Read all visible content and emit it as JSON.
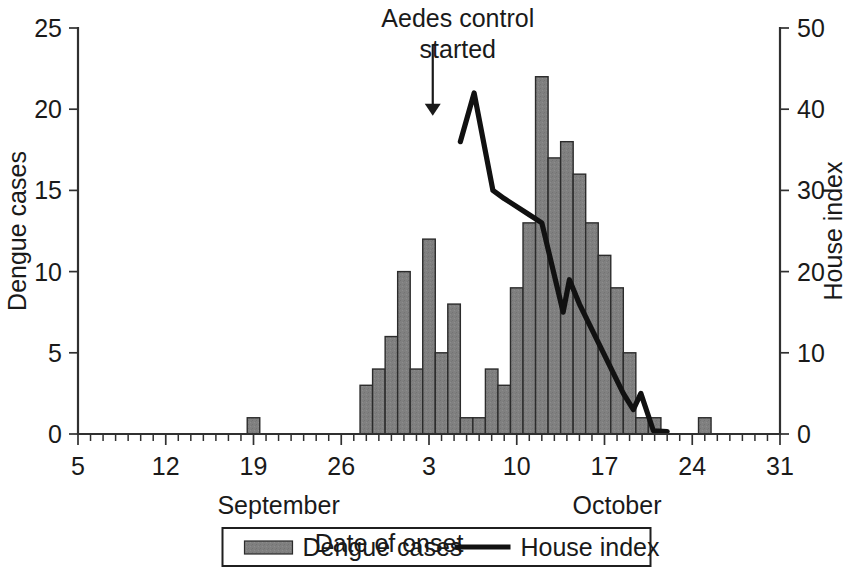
{
  "chart_data": {
    "type": "bar",
    "title": "",
    "xlabel": "Date of onset",
    "ylabel": "Dengue cases",
    "y2label": "House index",
    "ylim": [
      0,
      25
    ],
    "y2lim": [
      0,
      50
    ],
    "grid": false,
    "xlim_day": [
      5,
      31
    ],
    "x_tick_labels": [
      "5",
      "12",
      "19",
      "26",
      "3",
      "10",
      "17",
      "24",
      "31"
    ],
    "x_tick_days": [
      5,
      12,
      19,
      26,
      33,
      40,
      47,
      54,
      61
    ],
    "x_minor_step_days": 1,
    "y_tick_labels": [
      "0",
      "5",
      "10",
      "15",
      "20",
      "25"
    ],
    "y_tick_values": [
      0,
      5,
      10,
      15,
      20,
      25
    ],
    "y2_tick_labels": [
      "0",
      "10",
      "20",
      "30",
      "40",
      "50"
    ],
    "y2_tick_values": [
      0,
      10,
      20,
      30,
      40,
      50
    ],
    "month_labels": [
      {
        "text": "September",
        "day": 21
      },
      {
        "text": "October",
        "day": 48
      }
    ],
    "categories": [
      "Sep 19",
      "Sep 28",
      "Sep 29",
      "Sep 30",
      "Oct 1",
      "Oct 2",
      "Oct 3",
      "Oct 4",
      "Oct 5",
      "Oct 6",
      "Oct 7",
      "Oct 8",
      "Oct 9",
      "Oct 10",
      "Oct 11",
      "Oct 12",
      "Oct 13",
      "Oct 14",
      "Oct 15",
      "Oct 16",
      "Oct 17",
      "Oct 18",
      "Oct 19",
      "Oct 20",
      "Oct 21",
      "Oct 25"
    ],
    "series": [
      {
        "name": "Dengue cases",
        "kind": "bar",
        "axis": "left",
        "color": "#808080",
        "points": [
          {
            "day": 19,
            "value": 1
          },
          {
            "day": 28,
            "value": 3
          },
          {
            "day": 29,
            "value": 4
          },
          {
            "day": 30,
            "value": 6
          },
          {
            "day": 31,
            "value": 10
          },
          {
            "day": 32,
            "value": 4
          },
          {
            "day": 33,
            "value": 12
          },
          {
            "day": 34,
            "value": 5
          },
          {
            "day": 35,
            "value": 8
          },
          {
            "day": 36,
            "value": 1
          },
          {
            "day": 37,
            "value": 1
          },
          {
            "day": 38,
            "value": 4
          },
          {
            "day": 39,
            "value": 3
          },
          {
            "day": 40,
            "value": 9
          },
          {
            "day": 41,
            "value": 13
          },
          {
            "day": 42,
            "value": 22
          },
          {
            "day": 43,
            "value": 17
          },
          {
            "day": 44,
            "value": 18
          },
          {
            "day": 45,
            "value": 16
          },
          {
            "day": 46,
            "value": 13
          },
          {
            "day": 47,
            "value": 11
          },
          {
            "day": 48,
            "value": 9
          },
          {
            "day": 49,
            "value": 5
          },
          {
            "day": 50,
            "value": 1
          },
          {
            "day": 51,
            "value": 1
          },
          {
            "day": 55,
            "value": 1
          }
        ]
      },
      {
        "name": "House index",
        "kind": "line",
        "axis": "right",
        "color": "#111111",
        "points": [
          {
            "day": 35.5,
            "value": 36
          },
          {
            "day": 36.6,
            "value": 42
          },
          {
            "day": 38.1,
            "value": 30
          },
          {
            "day": 39.0,
            "value": 29
          },
          {
            "day": 41.0,
            "value": 27
          },
          {
            "day": 42.0,
            "value": 26
          },
          {
            "day": 43.7,
            "value": 15
          },
          {
            "day": 44.2,
            "value": 19
          },
          {
            "day": 45.0,
            "value": 16
          },
          {
            "day": 48.5,
            "value": 5
          },
          {
            "day": 49.3,
            "value": 3
          },
          {
            "day": 49.9,
            "value": 5
          },
          {
            "day": 50.9,
            "value": 0.4
          },
          {
            "day": 52.0,
            "value": 0.3
          }
        ]
      }
    ],
    "annotations": [
      {
        "name": "aedes-control-annotation",
        "lines": [
          "Aedes control",
          "started"
        ],
        "arrow_day": 33.3,
        "arrow_from_value": 24.0,
        "arrow_to_value": 19.6
      }
    ],
    "legend": {
      "position": "bottom",
      "entries": [
        {
          "label": "Dengue cases",
          "marker": "swatch",
          "color": "#808080"
        },
        {
          "label": "House index",
          "marker": "line",
          "color": "#111111"
        }
      ]
    }
  }
}
